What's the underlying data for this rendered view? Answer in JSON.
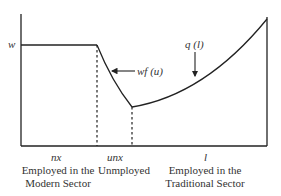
{
  "diagram": {
    "y_label": "w",
    "curve_labels": {
      "wf": "wf (u)",
      "q": "q (l)"
    },
    "segment_labels": {
      "modern": "nx",
      "unemployed": "unx",
      "traditional": "l"
    },
    "captions": {
      "modern_line1": "Employed in the",
      "modern_line2": "Modern Sector",
      "unemployed": "Unmployed",
      "traditional_line1": "Employed in the",
      "traditional_line2": "Traditional Sector"
    },
    "colors": {
      "line": "#222222",
      "background": "#ffffff"
    }
  }
}
